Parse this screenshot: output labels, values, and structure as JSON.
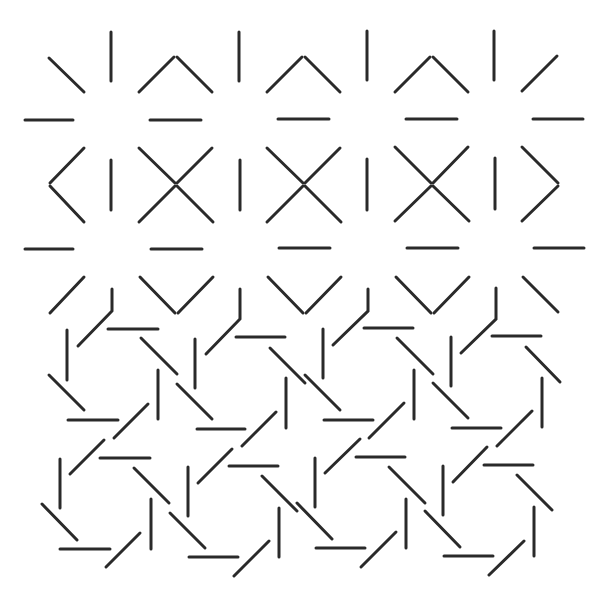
{
  "artwork": {
    "width": 608,
    "height": 603,
    "background": "#ffffff",
    "stroke_color": "#2a2a2a",
    "stroke_width": 3
  },
  "segments": [
    {
      "group": "row1",
      "x1": 49,
      "y1": 58,
      "x2": 84,
      "y2": 92
    },
    {
      "group": "row1",
      "x1": 111,
      "y1": 32,
      "x2": 111,
      "y2": 81
    },
    {
      "group": "row1",
      "x1": 139,
      "y1": 92,
      "x2": 174,
      "y2": 57
    },
    {
      "group": "row1",
      "x1": 177,
      "y1": 57,
      "x2": 212,
      "y2": 92
    },
    {
      "group": "row1",
      "x1": 239,
      "y1": 32,
      "x2": 239,
      "y2": 81
    },
    {
      "group": "row1",
      "x1": 267,
      "y1": 92,
      "x2": 302,
      "y2": 57
    },
    {
      "group": "row1",
      "x1": 305,
      "y1": 57,
      "x2": 340,
      "y2": 92
    },
    {
      "group": "row1",
      "x1": 367,
      "y1": 31,
      "x2": 367,
      "y2": 80
    },
    {
      "group": "row1",
      "x1": 395,
      "y1": 92,
      "x2": 430,
      "y2": 57
    },
    {
      "group": "row1",
      "x1": 433,
      "y1": 57,
      "x2": 468,
      "y2": 92
    },
    {
      "group": "row1",
      "x1": 494,
      "y1": 31,
      "x2": 494,
      "y2": 80
    },
    {
      "group": "row1",
      "x1": 522,
      "y1": 91,
      "x2": 557,
      "y2": 56
    },
    {
      "group": "hrow1",
      "x1": 25,
      "y1": 120,
      "x2": 73,
      "y2": 120
    },
    {
      "group": "hrow1",
      "x1": 150,
      "y1": 120,
      "x2": 201,
      "y2": 120
    },
    {
      "group": "hrow1",
      "x1": 278,
      "y1": 119,
      "x2": 329,
      "y2": 119
    },
    {
      "group": "hrow1",
      "x1": 406,
      "y1": 119,
      "x2": 457,
      "y2": 119
    },
    {
      "group": "hrow1",
      "x1": 533,
      "y1": 119,
      "x2": 583,
      "y2": 119
    },
    {
      "group": "row2",
      "x1": 84,
      "y1": 148,
      "x2": 50,
      "y2": 183
    },
    {
      "group": "row2",
      "x1": 50,
      "y1": 186,
      "x2": 84,
      "y2": 222
    },
    {
      "group": "row2",
      "x1": 111,
      "y1": 160,
      "x2": 111,
      "y2": 210
    },
    {
      "group": "row2",
      "x1": 139,
      "y1": 148,
      "x2": 175,
      "y2": 183
    },
    {
      "group": "row2",
      "x1": 177,
      "y1": 183,
      "x2": 212,
      "y2": 148
    },
    {
      "group": "row2",
      "x1": 139,
      "y1": 222,
      "x2": 175,
      "y2": 186
    },
    {
      "group": "row2",
      "x1": 177,
      "y1": 186,
      "x2": 213,
      "y2": 222
    },
    {
      "group": "row2",
      "x1": 240,
      "y1": 160,
      "x2": 240,
      "y2": 210
    },
    {
      "group": "row2",
      "x1": 267,
      "y1": 148,
      "x2": 303,
      "y2": 183
    },
    {
      "group": "row2",
      "x1": 305,
      "y1": 183,
      "x2": 340,
      "y2": 148
    },
    {
      "group": "row2",
      "x1": 267,
      "y1": 222,
      "x2": 303,
      "y2": 186
    },
    {
      "group": "row2",
      "x1": 305,
      "y1": 186,
      "x2": 341,
      "y2": 222
    },
    {
      "group": "row2",
      "x1": 367,
      "y1": 159,
      "x2": 367,
      "y2": 210
    },
    {
      "group": "row2",
      "x1": 395,
      "y1": 147,
      "x2": 431,
      "y2": 183
    },
    {
      "group": "row2",
      "x1": 433,
      "y1": 183,
      "x2": 468,
      "y2": 147
    },
    {
      "group": "row2",
      "x1": 395,
      "y1": 221,
      "x2": 431,
      "y2": 186
    },
    {
      "group": "row2",
      "x1": 433,
      "y1": 186,
      "x2": 469,
      "y2": 221
    },
    {
      "group": "row2",
      "x1": 495,
      "y1": 158,
      "x2": 495,
      "y2": 209
    },
    {
      "group": "row2",
      "x1": 522,
      "y1": 147,
      "x2": 558,
      "y2": 183
    },
    {
      "group": "row2",
      "x1": 558,
      "y1": 186,
      "x2": 522,
      "y2": 221
    },
    {
      "group": "hrow2",
      "x1": 25,
      "y1": 249,
      "x2": 73,
      "y2": 249
    },
    {
      "group": "hrow2",
      "x1": 151,
      "y1": 249,
      "x2": 202,
      "y2": 249
    },
    {
      "group": "hrow2",
      "x1": 279,
      "y1": 248,
      "x2": 330,
      "y2": 248
    },
    {
      "group": "hrow2",
      "x1": 407,
      "y1": 248,
      "x2": 458,
      "y2": 248
    },
    {
      "group": "hrow2",
      "x1": 534,
      "y1": 248,
      "x2": 584,
      "y2": 248
    },
    {
      "group": "row3",
      "x1": 84,
      "y1": 277,
      "x2": 50,
      "y2": 313
    },
    {
      "group": "row3",
      "x1": 140,
      "y1": 277,
      "x2": 175,
      "y2": 313
    },
    {
      "group": "row3",
      "x1": 178,
      "y1": 313,
      "x2": 213,
      "y2": 277
    },
    {
      "group": "row3",
      "x1": 268,
      "y1": 277,
      "x2": 303,
      "y2": 313
    },
    {
      "group": "row3",
      "x1": 306,
      "y1": 313,
      "x2": 341,
      "y2": 277
    },
    {
      "group": "row3",
      "x1": 396,
      "y1": 277,
      "x2": 431,
      "y2": 313
    },
    {
      "group": "row3",
      "x1": 434,
      "y1": 313,
      "x2": 469,
      "y2": 277
    },
    {
      "group": "row3",
      "x1": 523,
      "y1": 277,
      "x2": 558,
      "y2": 312
    },
    {
      "group": "pinwheel-1",
      "x1": 67,
      "y1": 330,
      "x2": 67,
      "y2": 380
    },
    {
      "group": "pinwheel-1",
      "x1": 49,
      "y1": 375,
      "x2": 84,
      "y2": 410
    },
    {
      "group": "pinwheel-1",
      "x1": 68,
      "y1": 420,
      "x2": 118,
      "y2": 420
    },
    {
      "group": "pinwheel-1",
      "x1": 114,
      "y1": 438,
      "x2": 148,
      "y2": 404
    },
    {
      "group": "pinwheel-1",
      "x1": 158,
      "y1": 370,
      "x2": 158,
      "y2": 419
    },
    {
      "group": "pinwheel-1",
      "x1": 141,
      "y1": 338,
      "x2": 177,
      "y2": 374
    },
    {
      "group": "pinwheel-1",
      "x1": 108,
      "y1": 329,
      "x2": 158,
      "y2": 329
    },
    {
      "group": "pinwheel-2",
      "x1": 195,
      "y1": 339,
      "x2": 195,
      "y2": 388
    },
    {
      "group": "pinwheel-2",
      "x1": 177,
      "y1": 384,
      "x2": 212,
      "y2": 419
    },
    {
      "group": "pinwheel-2",
      "x1": 197,
      "y1": 429,
      "x2": 245,
      "y2": 429
    },
    {
      "group": "pinwheel-2",
      "x1": 242,
      "y1": 446,
      "x2": 276,
      "y2": 412
    },
    {
      "group": "pinwheel-2",
      "x1": 286,
      "y1": 378,
      "x2": 286,
      "y2": 428
    },
    {
      "group": "pinwheel-2",
      "x1": 270,
      "y1": 348,
      "x2": 305,
      "y2": 383
    },
    {
      "group": "pinwheel-2",
      "x1": 236,
      "y1": 337,
      "x2": 285,
      "y2": 337
    },
    {
      "group": "pinwheel-3",
      "x1": 323,
      "y1": 329,
      "x2": 323,
      "y2": 378
    },
    {
      "group": "pinwheel-3",
      "x1": 305,
      "y1": 375,
      "x2": 340,
      "y2": 410
    },
    {
      "group": "pinwheel-3",
      "x1": 324,
      "y1": 420,
      "x2": 373,
      "y2": 420
    },
    {
      "group": "pinwheel-3",
      "x1": 369,
      "y1": 438,
      "x2": 404,
      "y2": 403
    },
    {
      "group": "pinwheel-3",
      "x1": 414,
      "y1": 370,
      "x2": 414,
      "y2": 419
    },
    {
      "group": "pinwheel-3",
      "x1": 397,
      "y1": 338,
      "x2": 433,
      "y2": 374
    },
    {
      "group": "pinwheel-3",
      "x1": 364,
      "y1": 328,
      "x2": 413,
      "y2": 328
    },
    {
      "group": "pinwheel-4",
      "x1": 451,
      "y1": 337,
      "x2": 451,
      "y2": 386
    },
    {
      "group": "pinwheel-4",
      "x1": 433,
      "y1": 383,
      "x2": 468,
      "y2": 418
    },
    {
      "group": "pinwheel-4",
      "x1": 452,
      "y1": 428,
      "x2": 501,
      "y2": 428
    },
    {
      "group": "pinwheel-4",
      "x1": 497,
      "y1": 446,
      "x2": 532,
      "y2": 411
    },
    {
      "group": "pinwheel-4",
      "x1": 542,
      "y1": 378,
      "x2": 542,
      "y2": 427
    },
    {
      "group": "pinwheel-4",
      "x1": 526,
      "y1": 347,
      "x2": 560,
      "y2": 382
    },
    {
      "group": "pinwheel-4",
      "x1": 492,
      "y1": 336,
      "x2": 541,
      "y2": 336
    },
    {
      "group": "pinwheel-5",
      "x1": 60,
      "y1": 459,
      "x2": 60,
      "y2": 508
    },
    {
      "group": "pinwheel-5",
      "x1": 42,
      "y1": 504,
      "x2": 77,
      "y2": 540
    },
    {
      "group": "pinwheel-5",
      "x1": 60,
      "y1": 549,
      "x2": 110,
      "y2": 549
    },
    {
      "group": "pinwheel-5",
      "x1": 106,
      "y1": 567,
      "x2": 140,
      "y2": 533
    },
    {
      "group": "pinwheel-5",
      "x1": 151,
      "y1": 499,
      "x2": 151,
      "y2": 549
    },
    {
      "group": "pinwheel-5",
      "x1": 134,
      "y1": 468,
      "x2": 169,
      "y2": 503
    },
    {
      "group": "pinwheel-5",
      "x1": 100,
      "y1": 458,
      "x2": 150,
      "y2": 458
    },
    {
      "group": "pinwheel-5",
      "x1": 70,
      "y1": 474,
      "x2": 104,
      "y2": 440
    },
    {
      "group": "pinwheel-6",
      "x1": 188,
      "y1": 467,
      "x2": 188,
      "y2": 516
    },
    {
      "group": "pinwheel-6",
      "x1": 170,
      "y1": 513,
      "x2": 205,
      "y2": 548
    },
    {
      "group": "pinwheel-6",
      "x1": 189,
      "y1": 557,
      "x2": 238,
      "y2": 557
    },
    {
      "group": "pinwheel-6",
      "x1": 234,
      "y1": 576,
      "x2": 269,
      "y2": 541
    },
    {
      "group": "pinwheel-6",
      "x1": 279,
      "y1": 508,
      "x2": 279,
      "y2": 557
    },
    {
      "group": "pinwheel-6",
      "x1": 262,
      "y1": 476,
      "x2": 297,
      "y2": 511
    },
    {
      "group": "pinwheel-6",
      "x1": 229,
      "y1": 466,
      "x2": 278,
      "y2": 466
    },
    {
      "group": "pinwheel-6",
      "x1": 198,
      "y1": 483,
      "x2": 232,
      "y2": 449
    },
    {
      "group": "pinwheel-7",
      "x1": 315,
      "y1": 458,
      "x2": 315,
      "y2": 507
    },
    {
      "group": "pinwheel-7",
      "x1": 297,
      "y1": 503,
      "x2": 332,
      "y2": 539
    },
    {
      "group": "pinwheel-7",
      "x1": 316,
      "y1": 548,
      "x2": 365,
      "y2": 548
    },
    {
      "group": "pinwheel-7",
      "x1": 361,
      "y1": 567,
      "x2": 396,
      "y2": 532
    },
    {
      "group": "pinwheel-7",
      "x1": 406,
      "y1": 499,
      "x2": 406,
      "y2": 548
    },
    {
      "group": "pinwheel-7",
      "x1": 389,
      "y1": 467,
      "x2": 425,
      "y2": 503
    },
    {
      "group": "pinwheel-7",
      "x1": 356,
      "y1": 457,
      "x2": 405,
      "y2": 457
    },
    {
      "group": "pinwheel-7",
      "x1": 325,
      "y1": 473,
      "x2": 360,
      "y2": 439
    },
    {
      "group": "pinwheel-8",
      "x1": 443,
      "y1": 466,
      "x2": 443,
      "y2": 515
    },
    {
      "group": "pinwheel-8",
      "x1": 425,
      "y1": 511,
      "x2": 460,
      "y2": 547
    },
    {
      "group": "pinwheel-8",
      "x1": 444,
      "y1": 556,
      "x2": 493,
      "y2": 556
    },
    {
      "group": "pinwheel-8",
      "x1": 489,
      "y1": 575,
      "x2": 524,
      "y2": 541
    },
    {
      "group": "pinwheel-8",
      "x1": 534,
      "y1": 507,
      "x2": 534,
      "y2": 556
    },
    {
      "group": "pinwheel-8",
      "x1": 517,
      "y1": 475,
      "x2": 552,
      "y2": 510
    },
    {
      "group": "pinwheel-8",
      "x1": 484,
      "y1": 465,
      "x2": 533,
      "y2": 465
    },
    {
      "group": "pinwheel-8",
      "x1": 453,
      "y1": 482,
      "x2": 487,
      "y2": 447
    }
  ],
  "bent_strokes": [
    {
      "group": "row3-bend",
      "points": "112,289 112,311 78,346"
    },
    {
      "group": "row3-bend",
      "points": "240,289 240,319 206,354"
    },
    {
      "group": "row3-bend",
      "points": "368,289 368,311 333,345"
    },
    {
      "group": "row3-bend",
      "points": "496,288 496,319 461,353"
    }
  ]
}
